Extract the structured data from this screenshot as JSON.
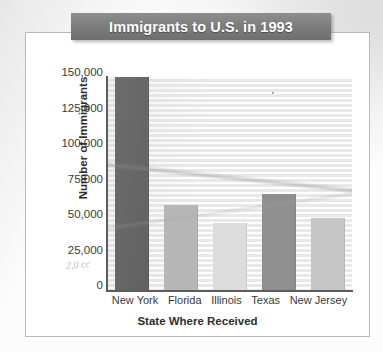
{
  "chart_data": {
    "type": "bar",
    "title": "Immigrants to U.S. in 1993",
    "xlabel": "State Where Received",
    "ylabel": "Number of Immigrants",
    "categories": [
      "New York",
      "Florida",
      "Illinois",
      "Texas",
      "New Jersey"
    ],
    "values": [
      150000,
      60000,
      47500,
      67500,
      50500
    ],
    "ylim": [
      0,
      150000
    ],
    "ytick_labels": [
      "150,000",
      "125,000",
      "100,000",
      "75,000",
      "50,000",
      "25,000",
      "0"
    ],
    "ytick_values": [
      150000,
      125000,
      100000,
      75000,
      50000,
      25000,
      0
    ],
    "grid": true,
    "legend": false,
    "bar_colors": [
      "#5c5c5c",
      "#b6b6b6",
      "#dcdcdc",
      "#8f8f8f",
      "#c6c6c6"
    ]
  },
  "artifacts": {
    "pencil_note": "2,0 cc"
  },
  "colors": {
    "title_banner": "#7b7b7b",
    "title_text": "#ffffff",
    "frame_border": "#b9b9b9",
    "axis_line": "#5d5d5d",
    "plot_background": "#f3f3f3"
  }
}
